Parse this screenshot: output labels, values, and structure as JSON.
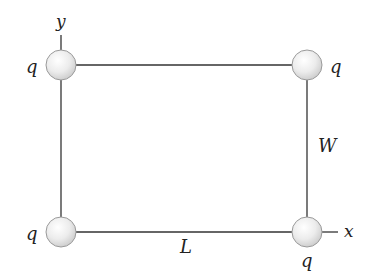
{
  "diagram": {
    "axes": {
      "x_label": "x",
      "y_label": "y"
    },
    "dimensions": {
      "length_label": "L",
      "width_label": "W"
    },
    "charges": [
      {
        "id": "top-left",
        "label": "q"
      },
      {
        "id": "top-right",
        "label": "q"
      },
      {
        "id": "bottom-left",
        "label": "q"
      },
      {
        "id": "bottom-right",
        "label": "q"
      }
    ],
    "colors": {
      "line": "#333333",
      "charge_fill": "#e6e6e6",
      "charge_stroke": "#9a9a9a"
    }
  }
}
